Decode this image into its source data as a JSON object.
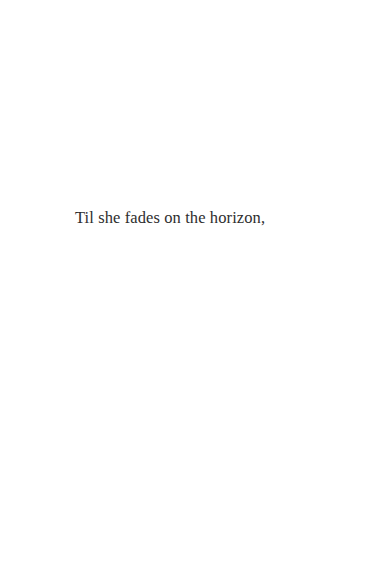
{
  "page": {
    "background": "#ffffff",
    "text_color": "#2e2e2e",
    "lines": [
      "Til she fades on the horizon,"
    ]
  }
}
